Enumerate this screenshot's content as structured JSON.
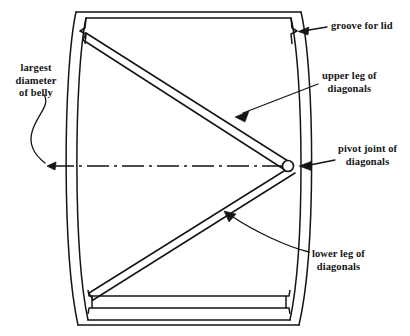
{
  "figure": {
    "type": "technical-line-drawing",
    "background_color": "#ffffff",
    "line_color": "#151515"
  },
  "labels": {
    "groove_for_lid": "groove for lid",
    "upper_leg_line1": "upper leg of",
    "upper_leg_line2": "diagonals",
    "pivot_joint_line1": "pivot joint of",
    "pivot_joint_line2": "diagonals",
    "lower_leg_line1": "lower leg of",
    "lower_leg_line2": "diagonals",
    "largest_diameter_line1": "largest",
    "largest_diameter_line2": "diameter",
    "largest_diameter_line3": "of belly"
  },
  "parts": {
    "barrel_outline": "barrel-body-outline",
    "left_stave_wall": "left-stave-wall",
    "right_stave_wall": "right-stave-wall",
    "top_head": "top-head-board",
    "bottom_head": "bottom-head-board",
    "upper_diagonal": "upper-diagonal-band",
    "lower_diagonal": "lower-diagonal-band",
    "pivot_circle": "pivot-joint-circle",
    "centerline": "belly-diameter-centerline"
  },
  "geometry": {
    "pivot_point": {
      "x": 288,
      "y": 166
    },
    "upper_diagonal_start": {
      "x": 86,
      "y": 34
    },
    "lower_diagonal_start": {
      "x": 89,
      "y": 298
    },
    "centerline_left_x": 47,
    "centerline_y": 166,
    "barrel_top_y": 8,
    "barrel_bottom_y": 328
  }
}
